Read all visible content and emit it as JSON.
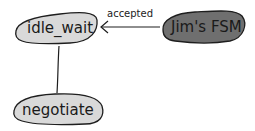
{
  "diagram": {
    "type": "state-machine",
    "nodes": [
      {
        "id": "idle_wait",
        "label": "idle_wait",
        "fill": "#d9d9d9"
      },
      {
        "id": "jims_fsm",
        "label": "Jim's FSM",
        "fill": "#6f6f6f"
      },
      {
        "id": "negotiate",
        "label": "negotiate",
        "fill": "#d9d9d9"
      }
    ],
    "edges": [
      {
        "from": "jims_fsm",
        "to": "idle_wait",
        "label": "accepted",
        "directed": true
      },
      {
        "from": "idle_wait",
        "to": "negotiate",
        "label": "",
        "directed": false
      }
    ],
    "colors": {
      "outline": "#1e1e1e",
      "light_fill": "#d9d9d9",
      "dark_fill": "#6f6f6f"
    }
  }
}
